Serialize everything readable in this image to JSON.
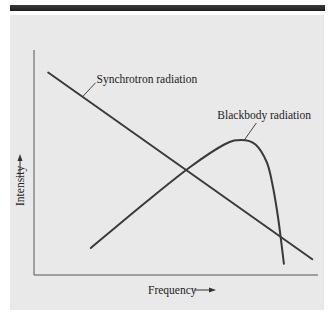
{
  "chart_data": {
    "type": "line",
    "title": "",
    "xlabel": "Frequency",
    "ylabel": "Intensity",
    "xlim": [
      0,
      100
    ],
    "ylim": [
      0,
      100
    ],
    "grid": false,
    "ticks": "none",
    "series": [
      {
        "name": "Synchrotron radiation",
        "shape": "straight decreasing line",
        "x": [
          5,
          98
        ],
        "y": [
          90,
          7
        ]
      },
      {
        "name": "Blackbody radiation",
        "shape": "rising curve with peak then steep drop",
        "x": [
          20,
          40,
          55,
          67,
          73,
          78,
          82,
          84,
          86,
          88
        ],
        "y": [
          12,
          33,
          48,
          58,
          60,
          58,
          50,
          40,
          25,
          5
        ]
      }
    ],
    "annotations": [
      {
        "text": "Synchrotron radiation",
        "points_to_series": "Synchrotron radiation"
      },
      {
        "text": "Blackbody radiation",
        "points_to_series": "Blackbody radiation",
        "at": "peak"
      }
    ]
  },
  "colors": {
    "background": "#e9e9e9",
    "lines": "#3a3a3a",
    "top_bar": "#2a2a2a"
  },
  "arrows": {
    "x_axis_arrow": "→",
    "y_axis_arrow": "↑"
  }
}
